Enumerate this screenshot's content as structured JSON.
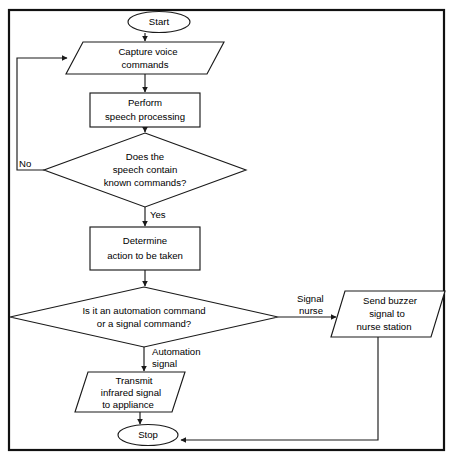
{
  "diagram": {
    "type": "flowchart",
    "colors": {
      "stroke": "#1a1a1a",
      "frame": "#111111",
      "fill": "#ffffff",
      "text": "#000000"
    },
    "nodes": [
      {
        "id": "start",
        "shape": "terminator",
        "label": "Start",
        "lines": [
          "Start"
        ],
        "cx": 159,
        "cy": 22,
        "w": 62,
        "h": 21
      },
      {
        "id": "capture-voice",
        "shape": "parallelogram",
        "label": "Capture voice commands",
        "lines": [
          "Capture voice",
          "commands"
        ],
        "cx": 145,
        "cy": 58,
        "w": 158,
        "h": 32,
        "skew": 17
      },
      {
        "id": "speech-processing",
        "shape": "process",
        "label": "Perform speech processing",
        "lines": [
          "Perform",
          "speech processing"
        ],
        "cx": 145,
        "cy": 110,
        "w": 110,
        "h": 34
      },
      {
        "id": "known-commands",
        "shape": "decision",
        "label": "Does the speech contain known commands?",
        "lines": [
          "Does the",
          "speech contain",
          "known commands?"
        ],
        "cx": 145,
        "cy": 170,
        "w": 201,
        "h": 74
      },
      {
        "id": "determine-action",
        "shape": "process",
        "label": "Determine action to be taken",
        "lines": [
          "Determine",
          "action to be taken"
        ],
        "cx": 145,
        "cy": 249,
        "w": 110,
        "h": 43
      },
      {
        "id": "command-kind",
        "shape": "decision",
        "label": "Is it an automation command or a signal command?",
        "lines": [
          "Is it an automation command",
          "or a signal command?"
        ],
        "cx": 144,
        "cy": 317,
        "w": 268,
        "h": 58
      },
      {
        "id": "send-buzzer",
        "shape": "parallelogram",
        "label": "Send buzzer signal to nurse station",
        "lines": [
          "Send buzzer",
          "signal to",
          "nurse station"
        ],
        "cx": 388,
        "cy": 314,
        "w": 115,
        "h": 46,
        "skew": 14
      },
      {
        "id": "transmit-infrared",
        "shape": "parallelogram",
        "label": "Transmit infrared signal to appliance",
        "lines": [
          "Transmit",
          "infrared signal",
          "to appliance"
        ],
        "cx": 130,
        "cy": 392,
        "w": 110,
        "h": 40,
        "skew": 14
      },
      {
        "id": "stop",
        "shape": "terminator",
        "label": "Stop",
        "lines": [
          "Stop"
        ],
        "cx": 148,
        "cy": 435,
        "w": 60,
        "h": 21
      }
    ],
    "edge_labels": [
      {
        "id": "no-label",
        "text": "No",
        "x": 19,
        "y": 164,
        "align": "start"
      },
      {
        "id": "yes-label",
        "text": "Yes",
        "x": 150,
        "y": 215,
        "align": "start"
      },
      {
        "id": "automation-signal-label-line1",
        "text": "Automation",
        "x": 152,
        "y": 352,
        "align": "start"
      },
      {
        "id": "automation-signal-label-line2",
        "text": "signal",
        "x": 152,
        "y": 364,
        "align": "start"
      },
      {
        "id": "signal-nurse-label-line1",
        "text": "Signal",
        "x": 297,
        "y": 299,
        "align": "start"
      },
      {
        "id": "signal-nurse-label-line2",
        "text": "nurse",
        "x": 297,
        "y": 311,
        "align": "start"
      }
    ],
    "edges": [
      {
        "from": "start",
        "to": "capture-voice",
        "label": ""
      },
      {
        "from": "capture-voice",
        "to": "speech-processing",
        "label": ""
      },
      {
        "from": "speech-processing",
        "to": "known-commands",
        "label": ""
      },
      {
        "from": "known-commands",
        "to": "capture-voice",
        "label": "No"
      },
      {
        "from": "known-commands",
        "to": "determine-action",
        "label": "Yes"
      },
      {
        "from": "determine-action",
        "to": "command-kind",
        "label": ""
      },
      {
        "from": "command-kind",
        "to": "send-buzzer",
        "label": "Signal nurse"
      },
      {
        "from": "command-kind",
        "to": "transmit-infrared",
        "label": "Automation signal"
      },
      {
        "from": "transmit-infrared",
        "to": "stop",
        "label": ""
      },
      {
        "from": "send-buzzer",
        "to": "stop",
        "label": ""
      }
    ]
  }
}
